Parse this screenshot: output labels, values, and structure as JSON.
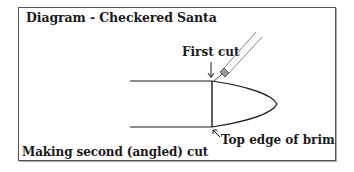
{
  "diagram": {
    "title": "Diagram - Checkered Santa",
    "labels": {
      "first_cut": "First cut",
      "top_edge": "Top edge of brim",
      "caption": "Making second (angled) cut"
    },
    "icons": {
      "first_cut_arrow": "down-arrow",
      "top_edge_arrow": "up-left-arrow",
      "tool": "craft-knife"
    },
    "colors": {
      "line": "#1a1a1a",
      "frame": "#555555",
      "tool": "#777777",
      "background": "#ffffff"
    }
  }
}
